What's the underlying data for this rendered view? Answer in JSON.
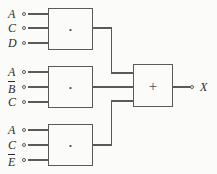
{
  "diagram": {
    "output_expression": "X = A·C·D + A·B̅·C + A·C·E̅",
    "colors": {
      "background": "#fbfbf9",
      "wire": "#5a5a5a",
      "text": "#2b2b2b"
    },
    "gates": [
      {
        "id": "and-gate-1",
        "type": "AND",
        "symbol": "·",
        "inputs": [
          {
            "label": "A",
            "overbar": false
          },
          {
            "label": "C",
            "overbar": false
          },
          {
            "label": "D",
            "overbar": false
          }
        ]
      },
      {
        "id": "and-gate-2",
        "type": "AND",
        "symbol": "·",
        "inputs": [
          {
            "label": "A",
            "overbar": false
          },
          {
            "label": "B",
            "overbar": true
          },
          {
            "label": "C",
            "overbar": false
          }
        ]
      },
      {
        "id": "and-gate-3",
        "type": "AND",
        "symbol": "·",
        "inputs": [
          {
            "label": "A",
            "overbar": false
          },
          {
            "label": "C",
            "overbar": false
          },
          {
            "label": "E",
            "overbar": true
          }
        ]
      },
      {
        "id": "or-gate",
        "type": "OR",
        "symbol": "+",
        "inputs": [
          {
            "label": "",
            "overbar": false
          },
          {
            "label": "",
            "overbar": false
          },
          {
            "label": "",
            "overbar": false
          }
        ]
      }
    ],
    "output": {
      "label": "X",
      "overbar": false
    }
  }
}
